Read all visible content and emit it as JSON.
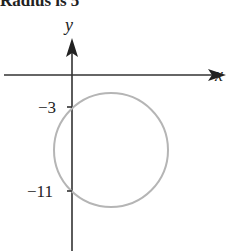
{
  "title": "Radius is 5",
  "axes": {
    "x_label": "x",
    "y_label": "y",
    "axis_color": "#333333"
  },
  "ticks": {
    "y_tick_1": "−3",
    "y_tick_2": "−11"
  },
  "circle": {
    "stroke_color": "#b5b5b5",
    "description": "Circle tangent region crossing y-axis at -3 and -11"
  }
}
